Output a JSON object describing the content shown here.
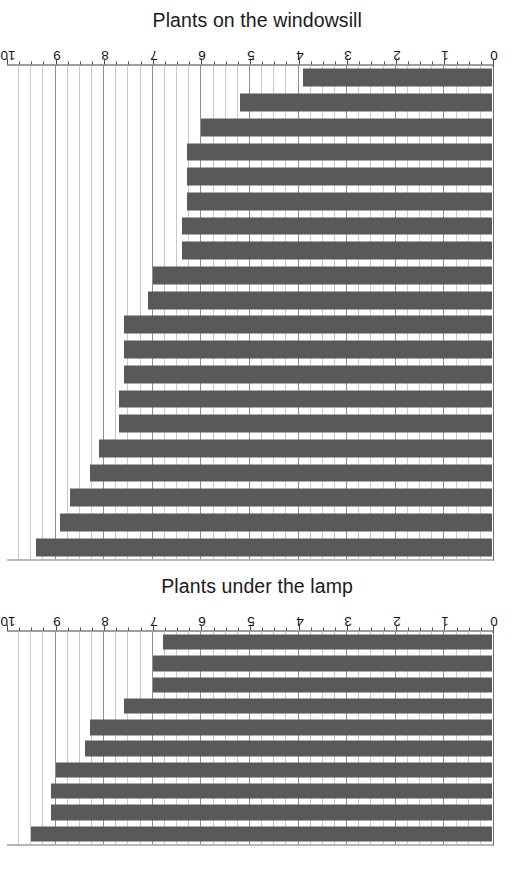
{
  "figure": {
    "orientation": "rotated-90",
    "background": "#ffffff",
    "bar_color": "#595959",
    "axis_color": "#3f3f3f",
    "grid_color": "#c9c9c9",
    "grid_major_color": "#8f8f8f"
  },
  "chart_data": [
    {
      "type": "bar",
      "title": "Plants on the windowsill",
      "xlabel": "",
      "ylabel": "",
      "orientation": "horizontal",
      "grid": true,
      "legend": "none",
      "axis_ticks": [
        "0",
        "1",
        "2",
        "3",
        "4",
        "5",
        "6",
        "7",
        "8",
        "9",
        "10"
      ],
      "xlim": [
        0,
        10
      ],
      "minor_tick_step": 0.25,
      "categories": [
        "1",
        "2",
        "3",
        "4",
        "5",
        "6",
        "7",
        "8",
        "9",
        "10",
        "11",
        "12",
        "13",
        "14",
        "15",
        "16",
        "17",
        "18",
        "19",
        "20"
      ],
      "values": [
        3.9,
        5.2,
        6.0,
        6.3,
        6.3,
        6.3,
        6.4,
        6.4,
        7.0,
        7.1,
        7.6,
        7.6,
        7.6,
        7.7,
        7.7,
        8.1,
        8.3,
        8.7,
        8.9,
        9.4
      ]
    },
    {
      "type": "bar",
      "title": "Plants under the lamp",
      "xlabel": "",
      "ylabel": "",
      "orientation": "horizontal",
      "grid": true,
      "legend": "none",
      "axis_ticks": [
        "0",
        "1",
        "2",
        "3",
        "4",
        "5",
        "6",
        "7",
        "8",
        "9",
        "10"
      ],
      "xlim": [
        0,
        10
      ],
      "minor_tick_step": 0.25,
      "categories": [
        "1",
        "2",
        "3",
        "4",
        "5",
        "6",
        "7",
        "8",
        "9",
        "10"
      ],
      "values": [
        6.8,
        7.0,
        7.0,
        7.6,
        8.3,
        8.4,
        9.0,
        9.1,
        9.1,
        9.5
      ]
    }
  ]
}
